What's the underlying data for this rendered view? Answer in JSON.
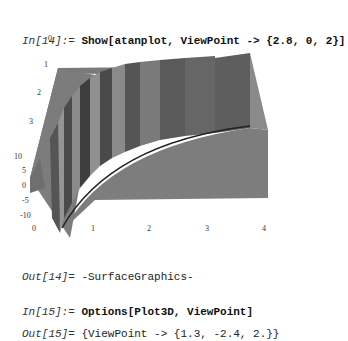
{
  "cells": [
    {
      "label": "In[14]:= ",
      "code": "Show[atanplot, ViewPoint -> {2.8, 0, 2}]"
    },
    {
      "label": "Out[14]= ",
      "code": "-SurfaceGraphics-"
    },
    {
      "label": "In[15]:= ",
      "code": "Options[Plot3D, ViewPoint]"
    },
    {
      "label": "Out[15]= ",
      "code": "{ViewPoint -> {1.3, -2.4, 2.}}"
    }
  ],
  "plot": {
    "y_ticks": [
      "0",
      "1",
      "2",
      "3"
    ],
    "z_ticks": [
      "10",
      "5",
      "0",
      "-5",
      "-10"
    ],
    "x_ticks": [
      "0",
      "1",
      "2",
      "3",
      "4"
    ],
    "colors": {
      "surface_light": "#8a8a8a",
      "surface_mid": "#6e6e6e",
      "surface_dark": "#3c3c3c",
      "floor": "#7d7d7d"
    }
  }
}
